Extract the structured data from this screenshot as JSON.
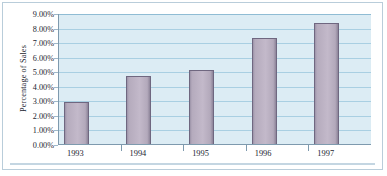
{
  "chart_data": {
    "type": "bar",
    "title": "",
    "subtitle": "",
    "xlabel": "",
    "ylabel": "Percentage of Sales",
    "categories": [
      "1993",
      "1994",
      "1995",
      "1996",
      "1997"
    ],
    "values": [
      2.9,
      4.65,
      5.1,
      7.3,
      8.3
    ],
    "series": [
      {
        "name": "Percentage of Sales",
        "values": [
          2.9,
          4.65,
          5.1,
          7.3,
          8.3
        ]
      }
    ],
    "ylim": [
      0,
      9
    ],
    "ytick_values": [
      0,
      1,
      2,
      3,
      4,
      5,
      6,
      7,
      8,
      9
    ],
    "ytick_labels": [
      "0.00%",
      "1.00%",
      "2.00%",
      "3.00%",
      "4.00%",
      "5.00%",
      "6.00%",
      "7.00%",
      "8.00%",
      "9.00%"
    ],
    "grid": true,
    "grid_axis": "y",
    "legend": false,
    "legend_position": "none",
    "annotations": [],
    "colors": {
      "bar_fill": "#c3b9ca",
      "bar_edge": "#6f6780",
      "plot_background": "#dcecf4",
      "gridline": "#a9cfe2",
      "axis_line": "#7e9aae",
      "text": "#1b2430",
      "figure_background": "#ffffff",
      "frame_border": "#b9cdda"
    }
  }
}
